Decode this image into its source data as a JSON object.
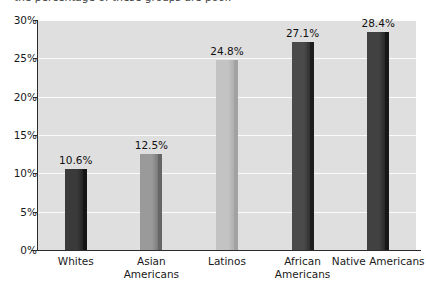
{
  "caption": {
    "text": "the percentage of these groups are poor."
  },
  "chart_data": {
    "type": "bar",
    "title": "",
    "subtitle": "",
    "xlabel": "",
    "ylabel": "",
    "categories": [
      "Whites",
      "Asian Americans",
      "Latinos",
      "African Americans",
      "Native Americans"
    ],
    "category_lines": [
      [
        "Whites"
      ],
      [
        "Asian",
        "Americans"
      ],
      [
        "Latinos"
      ],
      [
        "African",
        "Americans"
      ],
      [
        "Native Americans"
      ]
    ],
    "values": [
      10.6,
      12.5,
      24.8,
      27.1,
      28.4
    ],
    "value_labels": [
      "10.6%",
      "12.5%",
      "24.8%",
      "27.1%",
      "28.4%"
    ],
    "ylim": [
      0,
      30
    ],
    "ytick_values": [
      0,
      5,
      10,
      15,
      20,
      25,
      30
    ],
    "ytick_labels": [
      "0%",
      "5%",
      "10%",
      "15%",
      "20%",
      "25%",
      "30%"
    ],
    "grid": true,
    "grid_color": "#fbfbfb",
    "legend": null,
    "legend_position": "none",
    "plot_background": "#dfdfdf",
    "axis_color": "#2b2b2b",
    "bar_colors": [
      "#3a3a3a",
      "#9a9a9a",
      "#c3c3c3",
      "#4a4a4a",
      "#414141"
    ],
    "bar_edge_colors": [
      "#151515",
      "#666666",
      "#a2a2a2",
      "#1d1d1d",
      "#171717"
    ]
  }
}
